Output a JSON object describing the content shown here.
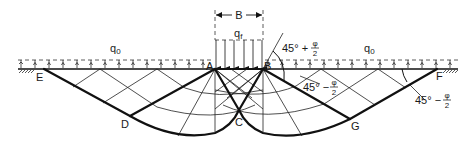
{
  "diagram": {
    "type": "bearing-capacity-failure-mechanism",
    "footing_width_label": "B",
    "footing_load_label": "q",
    "footing_load_subscript": "f",
    "surcharge_label": "q",
    "surcharge_subscript": "0",
    "points": {
      "A": "A",
      "B": "B",
      "C": "C",
      "D": "D",
      "E": "E",
      "F": "F",
      "G": "G"
    },
    "angles": {
      "wedge_angle_prefix": "45° +",
      "passive_angle_prefix": "45° −",
      "phi": "φ",
      "two": "2"
    },
    "colors": {
      "line": "#111111",
      "background": "#ffffff"
    }
  }
}
